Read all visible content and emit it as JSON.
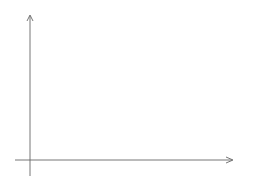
{
  "diagram": {
    "axes": {
      "x_label": "x",
      "y_label": "y"
    },
    "curve_label": "f(x)",
    "slope_formula": {
      "lhs": "m =",
      "numerator": "f(x + h) − f(x)",
      "denominator": "h"
    },
    "delta_y_label": "Δy = f(x + h) − f(x)",
    "delta_x_label": "Δx = h",
    "x1_label": "x₁ = x",
    "x2_label_line1": "x₂ = x + h",
    "x2_label_line2": "= x + Δx",
    "colors": {
      "curve": "#222222",
      "secant": "#8fd3e4",
      "dashed": "#6cc3d8",
      "axes": "#555555",
      "text": "#444444",
      "accent_text": "#6cc3d8"
    }
  }
}
